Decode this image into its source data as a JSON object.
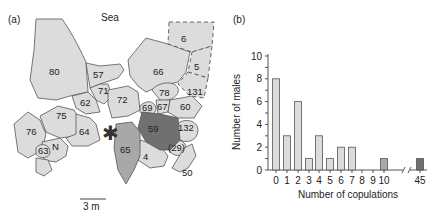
{
  "panel_a": {
    "label": "(a)",
    "sea_label": "Sea",
    "scale_label": "3 m",
    "marker": "*",
    "territories": [
      {
        "id": "80",
        "shade": "light"
      },
      {
        "id": "57",
        "shade": "light"
      },
      {
        "id": "71",
        "shade": "light"
      },
      {
        "id": "62",
        "shade": "light"
      },
      {
        "id": "72",
        "shade": "light"
      },
      {
        "id": "66",
        "shade": "light"
      },
      {
        "id": "6",
        "shade": "light-dashed"
      },
      {
        "id": "5",
        "shade": "light-dashed"
      },
      {
        "id": "131",
        "shade": "light-dashed"
      },
      {
        "id": "78",
        "shade": "light"
      },
      {
        "id": "69",
        "shade": "light"
      },
      {
        "id": "67",
        "shade": "light"
      },
      {
        "id": "60",
        "shade": "light"
      },
      {
        "id": "75",
        "shade": "light"
      },
      {
        "id": "76",
        "shade": "light"
      },
      {
        "id": "64",
        "shade": "light"
      },
      {
        "id": "63",
        "shade": "light"
      },
      {
        "id": "N",
        "shade": "light"
      },
      {
        "id": "65",
        "shade": "medium"
      },
      {
        "id": "59",
        "shade": "dark"
      },
      {
        "id": "132",
        "shade": "light"
      },
      {
        "id": "(29)",
        "shade": "light"
      },
      {
        "id": "4",
        "shade": "light"
      },
      {
        "id": "50",
        "shade": "light"
      }
    ]
  },
  "panel_b": {
    "label": "(b)"
  },
  "chart_data": {
    "type": "bar",
    "title": "",
    "xlabel": "Number of copulations",
    "ylabel": "Number of males",
    "categories": [
      "0",
      "1",
      "2",
      "3",
      "4",
      "5",
      "6",
      "7",
      "8",
      "9",
      "10",
      "45"
    ],
    "values": [
      8,
      3,
      6,
      1,
      3,
      1,
      2,
      2,
      0,
      0,
      1,
      1
    ],
    "bar_shades": [
      "light",
      "light",
      "light",
      "light",
      "light",
      "light",
      "light",
      "light",
      "light",
      "light",
      "medium",
      "dark"
    ],
    "ylim": [
      0,
      10
    ],
    "yticks": [
      "0",
      "2",
      "4",
      "6",
      "8",
      "10"
    ],
    "axis_break_between": [
      "10",
      "45"
    ],
    "grid": false,
    "legend": null
  },
  "colors": {
    "light": "#dcdcdc",
    "medium": "#a8a8a8",
    "dark": "#707070",
    "outline": "#555555"
  }
}
